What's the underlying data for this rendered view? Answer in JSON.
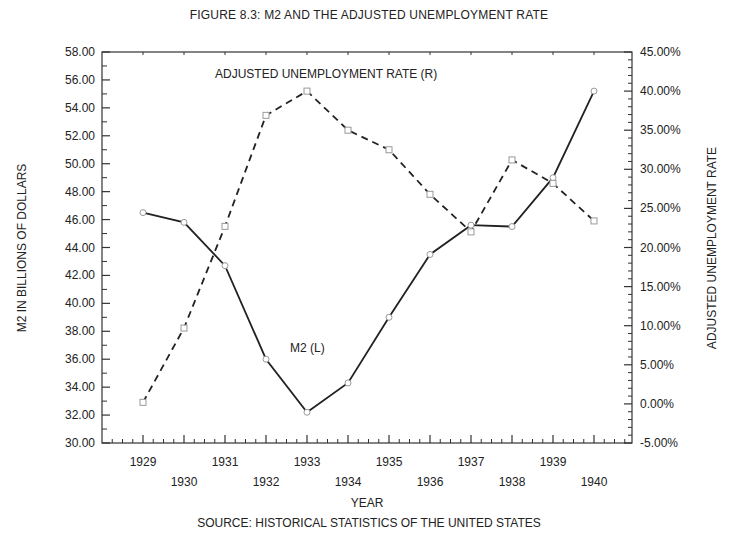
{
  "chart_data": {
    "type": "line",
    "title": "FIGURE 8.3: M2 AND THE ADJUSTED UNEMPLOYMENT RATE",
    "source": "SOURCE: HISTORICAL STATISTICS OF THE UNITED STATES",
    "xlabel": "YEAR",
    "ylabel_left": "M2 IN BILLIONS OF DOLLARS",
    "ylabel_right": "ADJUSTED UNEMPLOYMENT RATE",
    "x": [
      1929,
      1930,
      1931,
      1932,
      1933,
      1934,
      1935,
      1936,
      1937,
      1938,
      1939,
      1940
    ],
    "x_tick_labels_upper": [
      "1929",
      "1931",
      "1933",
      "1935",
      "1937",
      "1939"
    ],
    "x_tick_labels_lower": [
      "1930",
      "1932",
      "1934",
      "1936",
      "1938",
      "1940"
    ],
    "ylim_left": [
      30,
      58
    ],
    "ylim_right": [
      -5,
      45
    ],
    "y_ticks_left": [
      "58.00",
      "56.00",
      "54.00",
      "52.00",
      "50.00",
      "48.00",
      "46.00",
      "44.00",
      "42.00",
      "40.00",
      "38.00",
      "36.00",
      "34.00",
      "32.00",
      "30.00"
    ],
    "y_ticks_right": [
      "45.00%",
      "40.00%",
      "35.00%",
      "30.00%",
      "25.00%",
      "20.00%",
      "15.00%",
      "10.00%",
      "5.00%",
      "0.00%",
      "-5.00%"
    ],
    "series": [
      {
        "name": "M2 (L)",
        "axis": "left",
        "style": "solid",
        "values": [
          46.5,
          45.8,
          42.7,
          36.0,
          32.2,
          34.3,
          39.0,
          43.5,
          45.6,
          45.5,
          49.0,
          55.2
        ]
      },
      {
        "name": "ADJUSTED UNEMPLOYMENT RATE (R)",
        "axis": "right",
        "style": "dashed",
        "unit": "%",
        "values": [
          0.2,
          9.7,
          22.7,
          36.9,
          40.0,
          35.0,
          32.5,
          26.8,
          22.0,
          31.2,
          28.2,
          23.4
        ]
      }
    ],
    "annotations": [
      {
        "text": "ADJUSTED UNEMPLOYMENT RATE (R)",
        "series": 1
      },
      {
        "text": "M2 (L)",
        "series": 0
      }
    ],
    "grid": false,
    "legend": "inline annotations"
  }
}
